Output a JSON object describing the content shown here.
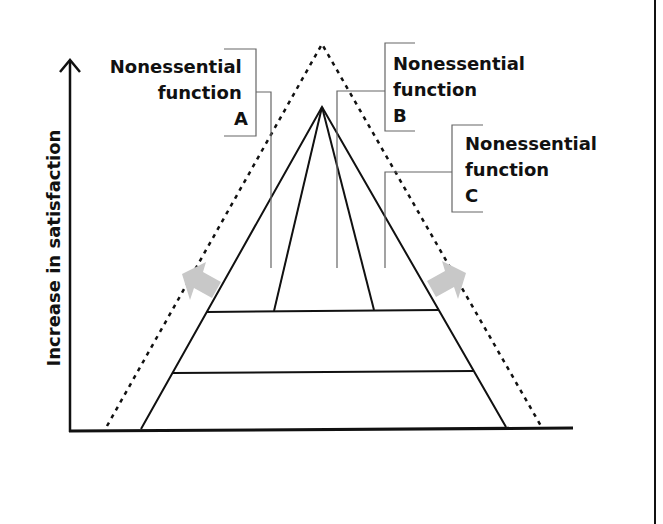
{
  "diagram": {
    "type": "pyramid",
    "y_axis_label": "Increase in satisfaction",
    "callouts": [
      {
        "id": "A",
        "lines": [
          "Nonessential",
          "function",
          "A"
        ],
        "align": "right"
      },
      {
        "id": "B",
        "lines": [
          "Nonessential",
          "function",
          "B"
        ],
        "align": "left"
      },
      {
        "id": "C",
        "lines": [
          "Nonessential",
          "function",
          "C"
        ],
        "align": "left"
      }
    ],
    "colors": {
      "line": "#111111",
      "leader": "#555555",
      "arrow": "#c8c8c8",
      "background": "#ffffff"
    }
  }
}
